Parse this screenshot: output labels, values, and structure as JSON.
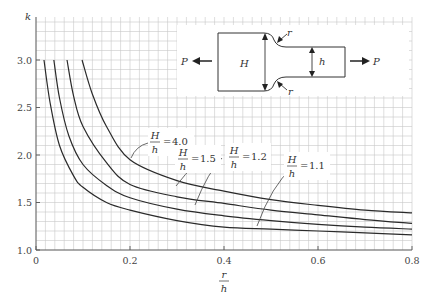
{
  "chart_data": {
    "type": "line",
    "title": "",
    "xlabel": "r/h",
    "ylabel": "k",
    "xlim": [
      0,
      0.8
    ],
    "ylim": [
      1.0,
      3.45
    ],
    "x_ticks": [
      "0",
      "0.2",
      "0.4",
      "0.6",
      "0.8"
    ],
    "y_ticks": [
      "1.0",
      "1.5",
      "2.0",
      "2.5",
      "3.0"
    ],
    "grid": true,
    "series": [
      {
        "name": "H/h = 4.0",
        "ratio": "4.0",
        "x": [
          0.098,
          0.12,
          0.15,
          0.2,
          0.3,
          0.4,
          0.5,
          0.6,
          0.7,
          0.8
        ],
        "y": [
          3.0,
          2.64,
          2.3,
          1.95,
          1.73,
          1.62,
          1.53,
          1.47,
          1.42,
          1.39
        ]
      },
      {
        "name": "H/h = 1.5",
        "ratio": "1.5",
        "x": [
          0.066,
          0.08,
          0.1,
          0.15,
          0.2,
          0.3,
          0.4,
          0.5,
          0.6,
          0.7,
          0.8
        ],
        "y": [
          3.0,
          2.62,
          2.3,
          1.92,
          1.69,
          1.56,
          1.49,
          1.42,
          1.37,
          1.32,
          1.28
        ]
      },
      {
        "name": "H/h = 1.2",
        "ratio": "1.2",
        "x": [
          0.038,
          0.05,
          0.07,
          0.1,
          0.15,
          0.2,
          0.3,
          0.4,
          0.5,
          0.6,
          0.7,
          0.8
        ],
        "y": [
          3.0,
          2.6,
          2.2,
          1.9,
          1.68,
          1.55,
          1.43,
          1.36,
          1.31,
          1.27,
          1.24,
          1.22
        ]
      },
      {
        "name": "H/h = 1.1",
        "ratio": "1.1",
        "x": [
          0.017,
          0.03,
          0.05,
          0.08,
          0.1,
          0.15,
          0.2,
          0.3,
          0.4,
          0.5,
          0.6,
          0.7,
          0.8
        ],
        "y": [
          3.0,
          2.55,
          2.1,
          1.78,
          1.66,
          1.5,
          1.42,
          1.31,
          1.24,
          1.22,
          1.2,
          1.18,
          1.16
        ]
      }
    ],
    "annotations": [
      {
        "text": "H/h = 4.0",
        "series": "4.0"
      },
      {
        "text": "H/h = 1.5",
        "series": "1.5"
      },
      {
        "text": "H/h = 1.2",
        "series": "1.2"
      },
      {
        "text": "H/h = 1.1",
        "series": "1.1"
      }
    ],
    "inset": {
      "description": "Stepped flat bar in tension with shoulder fillets",
      "labels": {
        "load_left": "P",
        "load_right": "P",
        "wide": "H",
        "narrow": "h",
        "fillet_top": "r",
        "fillet_bottom": "r"
      }
    }
  },
  "labels": {
    "ylabel": "k",
    "xlabel_num": "r",
    "xlabel_den": "h",
    "frac_num": "H",
    "frac_den": "h",
    "eq": "=",
    "r4": "4.0",
    "r15": "1.5",
    "r12": "1.2",
    "r11": "1.1",
    "P": "P",
    "H": "H",
    "h": "h",
    "r": "r"
  },
  "colors": {
    "grid": "#c8c8c8",
    "curve": "#2a2a2a",
    "axis": "#555555"
  }
}
